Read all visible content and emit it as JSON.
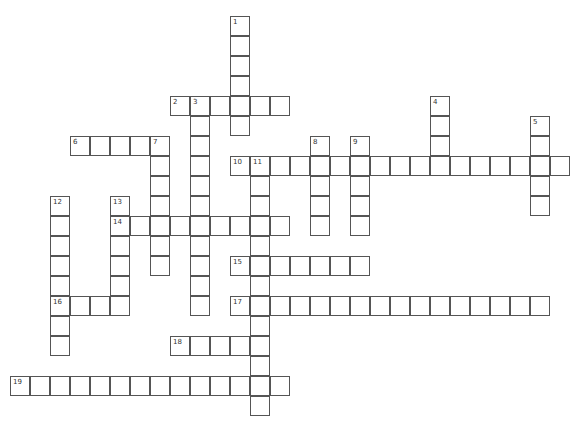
{
  "puzzle": {
    "type": "crossword",
    "cell_size": 20,
    "origin": {
      "x": 10,
      "y": 16
    },
    "entries": [
      {
        "number": 1,
        "direction": "down",
        "row": 0,
        "col": 11,
        "length": 6
      },
      {
        "number": 2,
        "direction": "across",
        "row": 4,
        "col": 8,
        "length": 6
      },
      {
        "number": 3,
        "direction": "down",
        "row": 4,
        "col": 9,
        "length": 11
      },
      {
        "number": 4,
        "direction": "down",
        "row": 4,
        "col": 21,
        "length": 4
      },
      {
        "number": 5,
        "direction": "down",
        "row": 5,
        "col": 26,
        "length": 5
      },
      {
        "number": 6,
        "direction": "across",
        "row": 6,
        "col": 3,
        "length": 5
      },
      {
        "number": 7,
        "direction": "down",
        "row": 6,
        "col": 7,
        "length": 7
      },
      {
        "number": 8,
        "direction": "down",
        "row": 6,
        "col": 15,
        "length": 5
      },
      {
        "number": 9,
        "direction": "down",
        "row": 6,
        "col": 17,
        "length": 5
      },
      {
        "number": 10,
        "direction": "across",
        "row": 7,
        "col": 11,
        "length": 17
      },
      {
        "number": 11,
        "direction": "down",
        "row": 7,
        "col": 12,
        "length": 13
      },
      {
        "number": 12,
        "direction": "down",
        "row": 9,
        "col": 2,
        "length": 8
      },
      {
        "number": 13,
        "direction": "down",
        "row": 9,
        "col": 5,
        "length": 6
      },
      {
        "number": 14,
        "direction": "across",
        "row": 10,
        "col": 5,
        "length": 9
      },
      {
        "number": 15,
        "direction": "across",
        "row": 12,
        "col": 11,
        "length": 7
      },
      {
        "number": 16,
        "direction": "across",
        "row": 14,
        "col": 2,
        "length": 4
      },
      {
        "number": 17,
        "direction": "across",
        "row": 14,
        "col": 11,
        "length": 16
      },
      {
        "number": 18,
        "direction": "across",
        "row": 16,
        "col": 8,
        "length": 5
      },
      {
        "number": 19,
        "direction": "across",
        "row": 18,
        "col": 0,
        "length": 14
      }
    ]
  }
}
